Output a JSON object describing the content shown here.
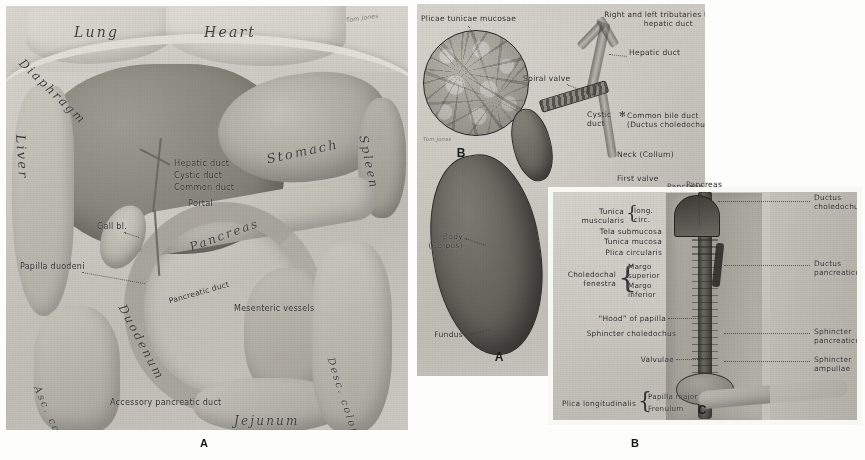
{
  "plate": {
    "title": "Gallbladder, biliary ducts and duodenal papilla",
    "background_color": "#ffffff",
    "panel_paper_color": "#cbc9c1",
    "ink_color": "#2a2a2c"
  },
  "panel_a": {
    "key": "A",
    "caption_key": "A",
    "signature": "Tom Jones",
    "labels": [
      {
        "text": "Lung",
        "style": "organ"
      },
      {
        "text": "Heart",
        "style": "organ"
      },
      {
        "text": "Diaphragm",
        "style": "organ"
      },
      {
        "text": "Liver",
        "style": "organ"
      },
      {
        "text": "Stomach",
        "style": "organ"
      },
      {
        "text": "Spleen",
        "style": "organ"
      },
      {
        "text": "Pancreas",
        "style": "organ"
      },
      {
        "text": "Duodenum",
        "style": "organ"
      },
      {
        "text": "Jejunum",
        "style": "organ"
      },
      {
        "text": "Asc. colon",
        "style": "organ"
      },
      {
        "text": "Desc. colon",
        "style": "organ"
      },
      {
        "text": "Hepatic duct",
        "style": "lab"
      },
      {
        "text": "Cystic duct",
        "style": "lab"
      },
      {
        "text": "Common duct",
        "style": "lab"
      },
      {
        "text": "Portal",
        "style": "lab"
      },
      {
        "text": "Gall bl.",
        "style": "lab"
      },
      {
        "text": "Papilla duodeni",
        "style": "lab"
      },
      {
        "text": "Pancreatic duct",
        "style": "lab"
      },
      {
        "text": "Mesenteric vessels",
        "style": "lab"
      },
      {
        "text": "Accessory pancreatic duct",
        "style": "lab"
      }
    ]
  },
  "panel_b": {
    "key": "A",
    "inset_key": "B",
    "inset_signature": "Tom Jones",
    "labels": {
      "plicae": "Plicae tunicae mucosae",
      "tributaries": "Right and left tributaries to\n        hepatic duct",
      "hepatic_duct": "Hepatic duct",
      "spiral_valve": "Spiral valve",
      "cystic_duct": "Cystic\nduct",
      "cystic_duct_mark": "✻",
      "common_bile_duct": "Common bile duct\n(Ductus choledochus)",
      "neck": "Neck (Collum)",
      "first_valve": "First valve",
      "pancreas": "Pancreas",
      "body": "Body\n(Corpus)",
      "fundus": "Fundus"
    }
  },
  "panel_c": {
    "key": "C",
    "caption_key": "B",
    "left_labels": [
      "Tunica\nmuscularis",
      "Tela submucosa",
      "Tunica mucosa",
      "Plica circularis",
      "Choledochal\nfenestra",
      "“Hood” of papilla",
      "Sphincter choledochus",
      "Valvulae",
      "Plica longitudinalis"
    ],
    "brace_groups": [
      {
        "label": "Tunica\nmuscularis",
        "items": [
          "long.",
          "circ."
        ]
      },
      {
        "label": "Choledochal\nfenestra",
        "items": [
          "Margo\nsuperior",
          "Margo\ninferior"
        ]
      },
      {
        "label": "Plica longitudinalis",
        "items": [
          "Papilla major",
          "Frenulum"
        ]
      }
    ],
    "right_labels": [
      "Ductus\ncholedochus",
      "Ductus\npancreaticus",
      "Sphincter\npancreaticus",
      "Sphincter\nampullae"
    ],
    "top_label": "Pancreas"
  },
  "captions": {
    "a": "A",
    "b": "B"
  }
}
